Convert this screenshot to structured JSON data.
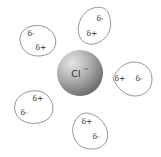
{
  "figure": {
    "background_color": "#ffffff"
  },
  "ion": {
    "name": "chloride-ion",
    "symbol": "Cl",
    "charge": "−",
    "label": "Cl−",
    "center": {
      "x": 80,
      "y": 73
    },
    "radius": 23,
    "highlight_color": "#dcdcdc",
    "mid_color": "#9d9d9d",
    "edge_color": "#6a6a6a",
    "text_color": "#2e2e2e"
  },
  "water_molecules": [
    {
      "name": "water-top",
      "position": "top",
      "outline_color": "#8a8a8a",
      "fill_color": "#ffffff",
      "labels": [
        {
          "text": "δ-",
          "role": "negative-pole",
          "x": 100,
          "y": 21
        },
        {
          "text": "δ+",
          "role": "positive-pole",
          "x": 92,
          "y": 36
        }
      ]
    },
    {
      "name": "water-top-left",
      "position": "top-left",
      "outline_color": "#8a8a8a",
      "fill_color": "#ffffff",
      "labels": [
        {
          "text": "δ-",
          "role": "negative-pole",
          "x": 31,
          "y": 36
        },
        {
          "text": "δ+",
          "role": "positive-pole",
          "x": 41,
          "y": 50
        }
      ]
    },
    {
      "name": "water-right",
      "position": "right",
      "outline_color": "#8a8a8a",
      "fill_color": "#ffffff",
      "labels": [
        {
          "text": "δ+",
          "role": "positive-pole",
          "x": 120,
          "y": 79
        },
        {
          "text": "δ-",
          "role": "negative-pole",
          "x": 139,
          "y": 79
        }
      ]
    },
    {
      "name": "water-bottom-left",
      "position": "bottom-left",
      "outline_color": "#8a8a8a",
      "fill_color": "#ffffff",
      "labels": [
        {
          "text": "δ+",
          "role": "positive-pole",
          "x": 38,
          "y": 100
        },
        {
          "text": "δ-",
          "role": "negative-pole",
          "x": 24,
          "y": 114
        }
      ]
    },
    {
      "name": "water-bottom",
      "position": "bottom",
      "outline_color": "#8a8a8a",
      "fill_color": "#ffffff",
      "labels": [
        {
          "text": "δ+",
          "role": "positive-pole",
          "x": 87,
          "y": 122
        },
        {
          "text": "δ-",
          "role": "negative-pole",
          "x": 96,
          "y": 138
        }
      ]
    }
  ]
}
